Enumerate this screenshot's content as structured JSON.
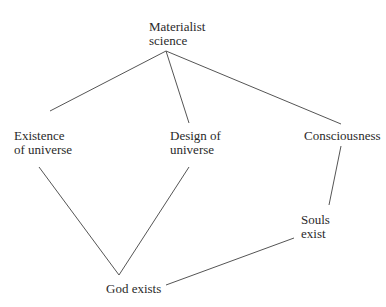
{
  "diagram": {
    "nodes": [
      {
        "id": "materialist",
        "lines": [
          "Materialist",
          "science"
        ],
        "x": 149,
        "y": 20
      },
      {
        "id": "existence",
        "lines": [
          "Existence",
          "of universe"
        ],
        "x": 14,
        "y": 128
      },
      {
        "id": "design",
        "lines": [
          "Design of",
          "universe"
        ],
        "x": 170,
        "y": 128
      },
      {
        "id": "consciousness",
        "lines": [
          "Consciousness"
        ],
        "x": 304,
        "y": 128
      },
      {
        "id": "souls",
        "lines": [
          "Souls",
          "exist"
        ],
        "x": 301,
        "y": 212
      },
      {
        "id": "god",
        "lines": [
          "God exists"
        ],
        "x": 106,
        "y": 282
      }
    ],
    "edges": [
      {
        "from": "materialist",
        "to": "existence",
        "x1": 166,
        "y1": 51,
        "x2": 50,
        "y2": 111
      },
      {
        "from": "materialist",
        "to": "design",
        "x1": 166,
        "y1": 51,
        "x2": 189,
        "y2": 123
      },
      {
        "from": "materialist",
        "to": "consciousness",
        "x1": 166,
        "y1": 51,
        "x2": 341,
        "y2": 124
      },
      {
        "from": "existence",
        "to": "god",
        "x1": 39,
        "y1": 167,
        "x2": 119,
        "y2": 275
      },
      {
        "from": "design",
        "to": "god",
        "x1": 189,
        "y1": 167,
        "x2": 119,
        "y2": 275
      },
      {
        "from": "consciousness",
        "to": "souls",
        "x1": 341,
        "y1": 146,
        "x2": 329,
        "y2": 205
      },
      {
        "from": "souls",
        "to": "god",
        "x1": 294,
        "y1": 238,
        "x2": 166,
        "y2": 285
      }
    ],
    "line_color": "#555555"
  }
}
